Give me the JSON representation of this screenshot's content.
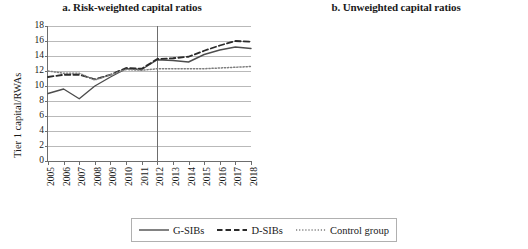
{
  "figure": {
    "legend": {
      "entries": [
        {
          "label": "G-SIBs",
          "style": "solid",
          "color": "#4d4d4d"
        },
        {
          "label": "D-SIBs",
          "style": "dashed",
          "color": "#2b2b2b"
        },
        {
          "label": "Control group",
          "style": "dotted",
          "color": "#7d7d7d"
        }
      ]
    }
  },
  "chart_data": [
    {
      "type": "line",
      "panel": "a",
      "title": "a. Risk-weighted capital ratios",
      "xlabel": "",
      "ylabel": "Tier 1 capital/RWAs",
      "x": [
        2005,
        2006,
        2007,
        2008,
        2009,
        2010,
        2011,
        2012,
        2013,
        2014,
        2015,
        2016,
        2017,
        2018
      ],
      "xtick_labels": [
        "2005",
        "2006",
        "2007",
        "2008",
        "2009",
        "2010",
        "2011",
        "2012",
        "2013",
        "2014",
        "2015",
        "2016",
        "2017",
        "2018"
      ],
      "ylim": [
        0,
        18
      ],
      "yticks": [
        0,
        2,
        4,
        6,
        8,
        10,
        12,
        14,
        16,
        18
      ],
      "grid": true,
      "legend_position": "below-figure",
      "annotations": [
        {
          "type": "vline",
          "x": 2012,
          "label": ""
        }
      ],
      "series": [
        {
          "name": "G-SIBs",
          "style": "solid",
          "values": [
            9.0,
            9.6,
            8.3,
            10.0,
            11.2,
            12.3,
            12.2,
            13.5,
            13.4,
            13.2,
            14.2,
            14.8,
            15.2,
            15.0
          ]
        },
        {
          "name": "D-SIBs",
          "style": "dashed",
          "values": [
            11.2,
            11.5,
            11.5,
            10.9,
            11.5,
            12.4,
            12.3,
            13.6,
            13.7,
            13.9,
            14.7,
            15.4,
            16.0,
            15.9
          ]
        },
        {
          "name": "Control group",
          "style": "dotted",
          "values": [
            12.0,
            11.7,
            11.7,
            10.8,
            11.5,
            12.2,
            12.1,
            12.3,
            12.3,
            12.3,
            12.3,
            12.4,
            12.5,
            12.6
          ]
        }
      ]
    },
    {
      "type": "line",
      "panel": "b",
      "title": "b. Unweighted capital ratios",
      "xlabel": "",
      "ylabel": "Tier 1 capital/total assets",
      "x": [
        2005,
        2006,
        2007,
        2008,
        2009,
        2010,
        2011,
        2012,
        2013,
        2014,
        2015,
        2016,
        2017,
        2018
      ],
      "xtick_labels": [
        "2005",
        "2006",
        "2007",
        "2008",
        "2009",
        "2010",
        "2011",
        "2012",
        "2013",
        "2014",
        "2015",
        "2016",
        "2017",
        "2018"
      ],
      "ylim": [
        0,
        10
      ],
      "yticks": [
        0,
        1,
        2,
        3,
        4,
        5,
        6,
        7,
        8,
        9,
        10
      ],
      "grid": true,
      "legend_position": "below-figure",
      "annotations": [
        {
          "type": "vline",
          "x": 2012,
          "label": ""
        }
      ],
      "series": [
        {
          "name": "G-SIBs",
          "style": "solid",
          "values": [
            5.65,
            5.0,
            4.0,
            4.1,
            4.6,
            5.05,
            4.95,
            5.2,
            5.5,
            5.8,
            6.1,
            6.15,
            6.2,
            6.25
          ]
        },
        {
          "name": "D-SIBs",
          "style": "dashed",
          "values": [
            6.6,
            6.4,
            6.6,
            6.3,
            6.9,
            7.4,
            7.6,
            8.2,
            8.0,
            7.9,
            8.1,
            8.3,
            8.6,
            8.9
          ]
        },
        {
          "name": "Control group",
          "style": "dotted",
          "values": [
            8.1,
            8.0,
            7.7,
            8.2,
            7.0,
            7.0,
            7.0,
            7.05,
            7.3,
            7.35,
            7.4,
            7.4,
            7.4,
            7.45
          ]
        }
      ]
    }
  ]
}
